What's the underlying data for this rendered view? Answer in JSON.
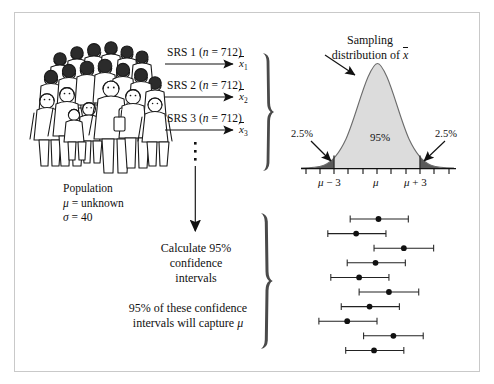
{
  "figure": {
    "population": {
      "title": "Population",
      "mu_line": "μ = unknown",
      "sigma_line": "σ = 40",
      "crowd_icon": "crowd-of-people-icon"
    },
    "samples": [
      {
        "label_prefix": "SRS 1 (",
        "label_n": "n",
        "label_suffix": " = 712)",
        "mean_symbol": "x",
        "mean_subscript": "1"
      },
      {
        "label_prefix": "SRS 2 (",
        "label_n": "n",
        "label_suffix": " = 712)",
        "mean_symbol": "x",
        "mean_subscript": "2"
      },
      {
        "label_prefix": "SRS 3 (",
        "label_n": "n",
        "label_suffix": " = 712)",
        "mean_symbol": "x",
        "mean_subscript": "3"
      }
    ],
    "vertical_ellipsis": "three-vertical-dots-icon",
    "down_arrow": "down-arrow-icon",
    "sampling_distribution": {
      "title_line1": "Sampling",
      "title_line2_prefix": "distribution of ",
      "title_line2_symbol": "x",
      "left_tail_pct": "2.5%",
      "right_tail_pct": "2.5%",
      "center_pct": "95%",
      "axis_labels": [
        "μ − 3",
        "μ",
        "μ + 3"
      ],
      "curve_fill": "#dcdcdc",
      "tail_fill": "#5a5a5a",
      "axis_color": "#111111"
    },
    "calculate_block": {
      "line1": "Calculate 95%",
      "line2": "confidence",
      "line3": "intervals"
    },
    "capture_block": {
      "line1": "95% of these confidence",
      "line2_prefix": "intervals will capture ",
      "line2_symbol": "μ"
    },
    "braces": [
      "sample-means-brace",
      "confidence-intervals-brace"
    ],
    "colors": {
      "ink": "#111111",
      "frame": "#c9c9c9",
      "page": "#ffffff"
    }
  },
  "chart_data": {
    "type": "line",
    "normal_curve": {
      "center": 0,
      "sd": 1.5,
      "x_range": [
        -5.2,
        5.2
      ],
      "shaded_center_pct": 95,
      "shaded_tail_pct": 2.5,
      "boundaries": [
        -3,
        3
      ],
      "tick_positions": [
        -5,
        -4,
        -3,
        -2,
        -1,
        0,
        1,
        2,
        3,
        4,
        5
      ],
      "labeled_ticks": [
        {
          "x": -3,
          "label": "μ − 3"
        },
        {
          "x": 0,
          "label": "μ"
        },
        {
          "x": 3,
          "label": "μ + 3"
        }
      ]
    },
    "confidence_intervals": [
      {
        "index": 1,
        "lower": -1.9,
        "estimate": 0.0,
        "upper": 2.0,
        "captures_mu": true
      },
      {
        "index": 2,
        "lower": -3.4,
        "estimate": -1.5,
        "upper": 0.5,
        "captures_mu": true
      },
      {
        "index": 3,
        "lower": -0.3,
        "estimate": 1.7,
        "upper": 3.7,
        "captures_mu": true
      },
      {
        "index": 4,
        "lower": -2.1,
        "estimate": -0.2,
        "upper": 1.8,
        "captures_mu": true
      },
      {
        "index": 5,
        "lower": -3.2,
        "estimate": -1.3,
        "upper": 0.7,
        "captures_mu": true
      },
      {
        "index": 6,
        "lower": -1.3,
        "estimate": 0.7,
        "upper": 2.7,
        "captures_mu": true
      },
      {
        "index": 7,
        "lower": -2.5,
        "estimate": -0.6,
        "upper": 1.4,
        "captures_mu": true
      },
      {
        "index": 8,
        "lower": -4.0,
        "estimate": -2.1,
        "upper": -0.1,
        "captures_mu": true
      },
      {
        "index": 9,
        "lower": -1.0,
        "estimate": 1.0,
        "upper": 3.0,
        "captures_mu": true
      },
      {
        "index": 10,
        "lower": -2.2,
        "estimate": -0.3,
        "upper": 1.7,
        "captures_mu": true
      }
    ],
    "ylabel": "",
    "xlabel": "",
    "grid": false
  }
}
